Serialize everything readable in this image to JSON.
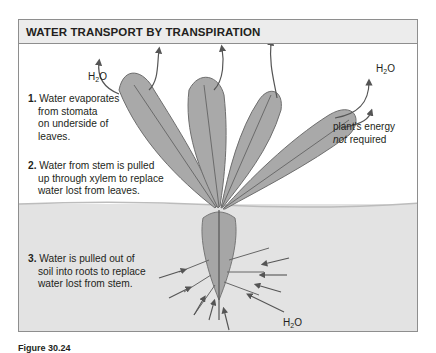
{
  "figure": {
    "title": "WATER TRANSPORT BY TRANSPIRATION",
    "steps": [
      {
        "number": "1.",
        "lines": [
          "Water evaporates",
          "from stomata",
          "on underside of",
          "leaves."
        ]
      },
      {
        "number": "2.",
        "lines": [
          "Water from stem is pulled",
          "up through xylem to replace",
          "water lost from leaves."
        ]
      },
      {
        "number": "3.",
        "lines": [
          "Water is pulled out of",
          "soil into roots to replace",
          "water lost from stem."
        ]
      }
    ],
    "water_labels": {
      "left": {
        "base": "H",
        "sub": "2",
        "tail": "O"
      },
      "right": {
        "base": "H",
        "sub": "2",
        "tail": "O"
      },
      "soil": {
        "base": "H",
        "sub": "2",
        "tail": "O"
      }
    },
    "energy_note": {
      "line1": "plant's energy",
      "emph": "not",
      "line2_rest": " required"
    },
    "caption": "Figure 30.24",
    "colors": {
      "header_bg": "#ececec",
      "border": "#8e8e8e",
      "soil": "#e3e3e3",
      "leaf": "#9a9a9a",
      "arrow": "#555555"
    }
  }
}
